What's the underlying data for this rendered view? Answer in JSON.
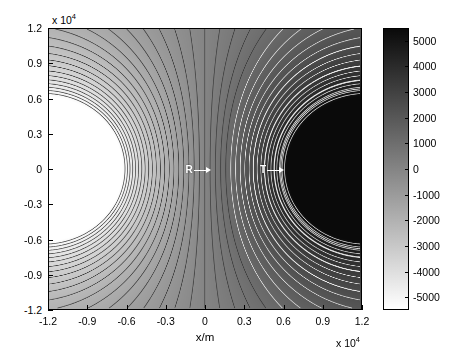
{
  "chart_data": {
    "type": "heatmap",
    "title": "",
    "xlabel": "x/m",
    "ylabel": "y/m",
    "x_multiplier": "x 10",
    "x_exponent": "4",
    "y_multiplier": "x 10",
    "y_exponent": "4",
    "xlim": [
      -12000,
      12000
    ],
    "ylim": [
      -12000,
      12000
    ],
    "xticks": [
      -12000,
      -9000,
      -6000,
      -3000,
      0,
      3000,
      6000,
      9000,
      12000
    ],
    "xtick_labels": [
      "-1.2",
      "-0.9",
      "-0.6",
      "-0.3",
      "0",
      "0.3",
      "0.6",
      "0.9",
      "1.2"
    ],
    "yticks": [
      -12000,
      -9000,
      -6000,
      -3000,
      0,
      3000,
      6000,
      9000,
      12000
    ],
    "ytick_labels": [
      "-1.2",
      "-0.9",
      "-0.6",
      "-0.3",
      "0",
      "0.3",
      "0.6",
      "0.9",
      "1.2"
    ],
    "grid": false,
    "legend": false,
    "colormap": "gray",
    "colorbar": {
      "position": "right",
      "vmin": -5500,
      "vmax": 5500,
      "ticks": [
        5000,
        4000,
        3000,
        2000,
        1000,
        0,
        -1000,
        -2000,
        -3000,
        -4000,
        -5000
      ],
      "tick_labels": [
        "5000",
        "4000",
        "3000",
        "2000",
        "1000",
        "0",
        "-1000",
        "-2000",
        "-3000",
        "-4000",
        "-5000"
      ],
      "top_color": "#0a0a0a",
      "bottom_color": "#ffffff"
    },
    "contour_levels": [
      -5000,
      -4500,
      -4000,
      -3500,
      -3000,
      -2500,
      -2000,
      -1500,
      -1000,
      -500,
      0,
      500,
      1000,
      1500,
      2000,
      2500,
      3000,
      3500,
      4000,
      4500,
      5000
    ],
    "dark_contour_color": "#3c3c3c",
    "light_contour_color": "#e8e8e8",
    "annotations": [
      {
        "name": "R",
        "label": "R",
        "x": -500,
        "y": 0,
        "arrow": "right"
      },
      {
        "name": "T",
        "label": "T",
        "x": 5200,
        "y": 0,
        "arrow": "right"
      }
    ],
    "sources": [
      {
        "label": "R",
        "x": -12000,
        "y": 0,
        "sign": "negative"
      },
      {
        "label": "T",
        "x": 12000,
        "y": 0,
        "sign": "positive"
      }
    ]
  }
}
